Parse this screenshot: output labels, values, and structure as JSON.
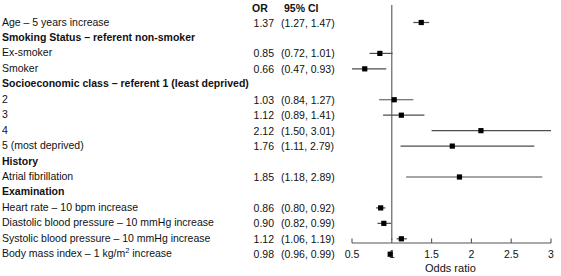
{
  "columns": {
    "or_header": "OR",
    "ci_header": "95% CI"
  },
  "axis": {
    "title": "Odds ratio",
    "ticks": [
      0.5,
      1,
      1.5,
      2,
      2.5,
      3
    ],
    "tick_labels": [
      "0.5",
      "1",
      "1.5",
      "2",
      "2.5",
      "3"
    ],
    "xmin": 0.5,
    "xmax": 3,
    "reference_line": 1
  },
  "rows": [
    {
      "label": "Age – 5 years increase",
      "bold": false,
      "or": "1.37",
      "ci": "(1.27, 1.47)",
      "est": 1.37,
      "lo": 1.27,
      "hi": 1.47
    },
    {
      "label": "Smoking Status – referent non-smoker",
      "bold": true,
      "or": "",
      "ci": "",
      "est": null,
      "lo": null,
      "hi": null
    },
    {
      "label": "Ex-smoker",
      "bold": false,
      "or": "0.85",
      "ci": "(0.72, 1.01)",
      "est": 0.85,
      "lo": 0.72,
      "hi": 1.01
    },
    {
      "label": "Smoker",
      "bold": false,
      "or": "0.66",
      "ci": "(0.47, 0.93)",
      "est": 0.66,
      "lo": 0.47,
      "hi": 0.93
    },
    {
      "label": "Socioeconomic class – referent 1 (least deprived)",
      "bold": true,
      "or": "",
      "ci": "",
      "est": null,
      "lo": null,
      "hi": null
    },
    {
      "label": "2",
      "bold": false,
      "or": "1.03",
      "ci": "(0.84, 1.27)",
      "est": 1.03,
      "lo": 0.84,
      "hi": 1.27
    },
    {
      "label": "3",
      "bold": false,
      "or": "1.12",
      "ci": "(0.89, 1.41)",
      "est": 1.12,
      "lo": 0.89,
      "hi": 1.41
    },
    {
      "label": "4",
      "bold": false,
      "or": "2.12",
      "ci": "(1.50, 3.01)",
      "est": 2.12,
      "lo": 1.5,
      "hi": 3.01
    },
    {
      "label": "5 (most deprived)",
      "bold": false,
      "or": "1.76",
      "ci": "(1.11, 2.79)",
      "est": 1.76,
      "lo": 1.11,
      "hi": 2.79
    },
    {
      "label": "History",
      "bold": true,
      "or": "",
      "ci": "",
      "est": null,
      "lo": null,
      "hi": null
    },
    {
      "label": "Atrial fibrillation",
      "bold": false,
      "or": "1.85",
      "ci": "(1.18, 2.89)",
      "est": 1.85,
      "lo": 1.18,
      "hi": 2.89
    },
    {
      "label": "Examination",
      "bold": true,
      "or": "",
      "ci": "",
      "est": null,
      "lo": null,
      "hi": null
    },
    {
      "label": "Heart rate – 10 bpm increase",
      "bold": false,
      "or": "0.86",
      "ci": "(0.80, 0.92)",
      "est": 0.86,
      "lo": 0.8,
      "hi": 0.92
    },
    {
      "label": "Diastolic blood pressure  – 10 mmHg increase",
      "bold": false,
      "or": "0.90",
      "ci": "(0.82, 0.99)",
      "est": 0.9,
      "lo": 0.82,
      "hi": 0.99
    },
    {
      "label": "Systolic blood pressure  – 10 mmHg increase",
      "bold": false,
      "or": "1.12",
      "ci": "(1.06, 1.19)",
      "est": 1.12,
      "lo": 1.06,
      "hi": 1.19
    },
    {
      "label": "Body mass index  – 1 kg/m<sup>2</sup> increase",
      "bold": false,
      "html": true,
      "or": "0.98",
      "ci": "(0.96, 0.99)",
      "est": 0.98,
      "lo": 0.96,
      "hi": 0.99
    }
  ],
  "chart_data": {
    "type": "scatter",
    "title": "",
    "xlabel": "Odds ratio",
    "ylabel": "",
    "xlim": [
      0.5,
      3
    ],
    "xticks": [
      0.5,
      1,
      1.5,
      2,
      2.5,
      3
    ],
    "grid": false,
    "legend": "none",
    "reference_line": 1,
    "categories": [
      "Age – 5 years increase",
      "Ex-smoker",
      "Smoker",
      "Socioeconomic class 2",
      "Socioeconomic class 3",
      "Socioeconomic class 4",
      "Socioeconomic class 5 (most deprived)",
      "Atrial fibrillation",
      "Heart rate – 10 bpm increase",
      "Diastolic blood pressure – 10 mmHg increase",
      "Systolic blood pressure – 10 mmHg increase",
      "Body mass index – 1 kg/m2 increase"
    ],
    "values": [
      1.37,
      0.85,
      0.66,
      1.03,
      1.12,
      2.12,
      1.76,
      1.85,
      0.86,
      0.9,
      1.12,
      0.98
    ],
    "ci_lower": [
      1.27,
      0.72,
      0.47,
      0.84,
      0.89,
      1.5,
      1.11,
      1.18,
      0.8,
      0.82,
      1.06,
      0.96
    ],
    "ci_upper": [
      1.47,
      1.01,
      0.93,
      1.27,
      1.41,
      3.01,
      2.79,
      2.89,
      0.92,
      0.99,
      1.19,
      0.99
    ]
  },
  "colors": {
    "marker": "#000000",
    "line": "#4d4d4d",
    "axis": "#555555",
    "text": "#111111"
  }
}
